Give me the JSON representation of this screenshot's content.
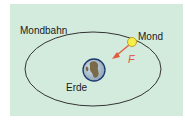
{
  "diagram": {
    "title": "",
    "labels": {
      "orbit": "Mondbahn",
      "moon": "Mond",
      "earth": "Erde",
      "force": "F",
      "force_vector_mark": "→"
    },
    "colors": {
      "background": "#d3ebdd",
      "orbit_line": "#333333",
      "moon_fill": "#f4ee4a",
      "moon_stroke": "#c8a020",
      "force_arrow": "#e05a3e",
      "earth_ocean": "#9bb4c8",
      "earth_land": "#7a6a48",
      "earth_ring": "#1f3a70"
    },
    "elements": [
      {
        "id": "orbit",
        "shape": "ellipse",
        "label": "Mondbahn"
      },
      {
        "id": "moon",
        "shape": "circle",
        "label": "Mond"
      },
      {
        "id": "earth",
        "shape": "circle",
        "label": "Erde"
      },
      {
        "id": "force",
        "shape": "arrow",
        "label": "F",
        "direction": "from moon toward earth"
      }
    ]
  }
}
